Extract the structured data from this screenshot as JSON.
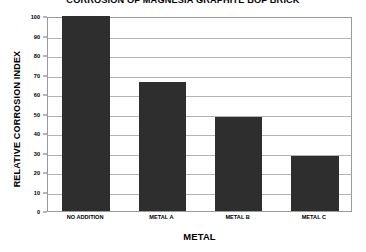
{
  "chart_data": {
    "type": "bar",
    "title": "CORROSION OF MAGNESIA GRAPHITE BOF BRICK",
    "xlabel": "METAL",
    "ylabel": "RELATIVE CORROSION INDEX",
    "categories": [
      "NO ADDITION",
      "METAL A",
      "METAL B",
      "METAL C"
    ],
    "values": [
      100,
      66,
      48,
      28
    ],
    "ylim": [
      0,
      100
    ],
    "ytick_step": 10,
    "yticks": [
      0,
      10,
      20,
      30,
      40,
      50,
      60,
      70,
      80,
      90,
      100
    ],
    "ytick_labels": [
      "0",
      "10",
      "20",
      "30",
      "40",
      "50",
      "60",
      "70",
      "80",
      "90",
      "100"
    ],
    "grid": true,
    "legend": false,
    "bar_color": "#2e2e2e",
    "plot_background": "#ffffff",
    "gridline_color": "#b4b4b4",
    "frame_color": "#9a9a9a"
  }
}
